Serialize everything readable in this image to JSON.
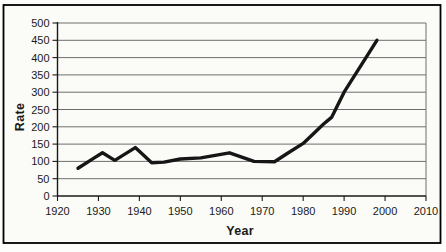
{
  "chart_data": {
    "type": "line",
    "title": "",
    "xlabel": "Year",
    "ylabel": "Rate",
    "xlim": [
      1920,
      2010
    ],
    "ylim": [
      0,
      500
    ],
    "x_ticks": [
      1920,
      1930,
      1940,
      1950,
      1960,
      1970,
      1980,
      1990,
      2000,
      2010
    ],
    "y_ticks": [
      0,
      50,
      100,
      150,
      200,
      250,
      300,
      350,
      400,
      450,
      500
    ],
    "grid": "horizontal",
    "legend": "none",
    "series": [
      {
        "name": "Rate",
        "points": [
          [
            1925,
            80
          ],
          [
            1929,
            110
          ],
          [
            1931,
            125
          ],
          [
            1934,
            103
          ],
          [
            1939,
            140
          ],
          [
            1943,
            96
          ],
          [
            1946,
            98
          ],
          [
            1950,
            107
          ],
          [
            1955,
            110
          ],
          [
            1962,
            125
          ],
          [
            1968,
            100
          ],
          [
            1973,
            99
          ],
          [
            1976,
            122
          ],
          [
            1980,
            152
          ],
          [
            1985,
            208
          ],
          [
            1987,
            228
          ],
          [
            1990,
            300
          ],
          [
            1998,
            450
          ]
        ]
      }
    ],
    "colors": {
      "line": "#161616",
      "grid": "#6e6e6e",
      "axis": "#1a1a1a",
      "text": "#1a1a1a",
      "frame": "#000000",
      "paper": "#fbfbf8"
    }
  }
}
